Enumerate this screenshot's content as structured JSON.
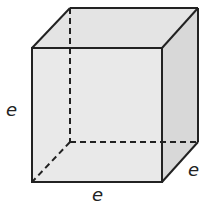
{
  "diagram": {
    "type": "cube",
    "colors": {
      "face": "#e6e6e6",
      "side": "#dcdcdc",
      "stroke": "#222222"
    },
    "labels": {
      "height": "e",
      "width": "e",
      "depth": "e"
    }
  }
}
